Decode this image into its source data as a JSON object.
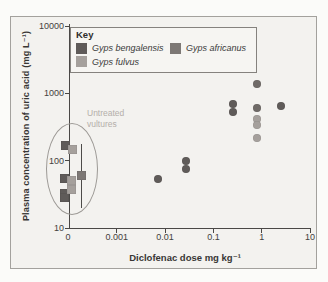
{
  "figure": {
    "legend": {
      "title": "Key",
      "entries": [
        {
          "label": "Gyps bengalensis",
          "color": "#5f5b59"
        },
        {
          "label": "Gyps africanus",
          "color": "#7d7875"
        },
        {
          "label": "Gyps fulvus",
          "color": "#a5a09c"
        }
      ]
    },
    "annotation": {
      "line1": "Untreated",
      "line2": "vultures",
      "color": "#b3afaa"
    }
  },
  "chart_data": {
    "type": "scatter",
    "title": "",
    "xlabel": "Diclofenac dose mg kg⁻¹",
    "ylabel": "Plasma concentration of uric acid (mg L⁻¹)",
    "x_scale": "log",
    "y_scale": "log",
    "xlim": [
      0,
      10
    ],
    "ylim": [
      10,
      10000
    ],
    "grid": false,
    "legend_position": "top-left",
    "x_ticks": [
      {
        "label": "0",
        "value": 0
      },
      {
        "label": "0.001",
        "value": 0.001
      },
      {
        "label": "0.01",
        "value": 0.01
      },
      {
        "label": "0.1",
        "value": 0.1
      },
      {
        "label": "1",
        "value": 1
      },
      {
        "label": "10",
        "value": 10
      }
    ],
    "y_ticks": [
      {
        "label": "10",
        "value": 10
      },
      {
        "label": "100",
        "value": 100
      },
      {
        "label": "1000",
        "value": 1000
      },
      {
        "label": "10000",
        "value": 10000
      }
    ],
    "annotations": [
      {
        "text": "Untreated vultures",
        "target": "dose-zero cluster circled by ellipse"
      }
    ],
    "series": [
      {
        "name": "Gyps bengalensis (treated)",
        "species": "Gyps bengalensis",
        "marker": "circle",
        "group": "treated",
        "color": "#5f5b59",
        "points": [
          {
            "dose": 0.007,
            "uric": 54
          },
          {
            "dose": 0.027,
            "uric": 100
          },
          {
            "dose": 0.027,
            "uric": 75
          },
          {
            "dose": 0.25,
            "uric": 700
          },
          {
            "dose": 0.25,
            "uric": 530
          },
          {
            "dose": 2.5,
            "uric": 650
          }
        ]
      },
      {
        "name": "Gyps africanus (treated)",
        "species": "Gyps africanus",
        "marker": "circle",
        "group": "treated",
        "color": "#6f6a67",
        "points": [
          {
            "dose": 0.8,
            "uric": 1400
          },
          {
            "dose": 0.8,
            "uric": 600
          }
        ]
      },
      {
        "name": "Gyps fulvus (treated)",
        "species": "Gyps fulvus",
        "marker": "circle",
        "group": "treated",
        "color": "#a5a09c",
        "points": [
          {
            "dose": 0.8,
            "uric": 420
          },
          {
            "dose": 0.8,
            "uric": 340
          },
          {
            "dose": 0.8,
            "uric": 215
          }
        ]
      },
      {
        "name": "Gyps bengalensis (untreated)",
        "species": "Gyps bengalensis",
        "marker": "square",
        "group": "untreated",
        "color": "#5f5b59",
        "points": [
          {
            "dose": 0,
            "uric": 170,
            "x_px": 65
          },
          {
            "dose": 0,
            "uric": 55,
            "x_px": 64
          },
          {
            "dose": 0,
            "uric": 33,
            "x_px": 64
          },
          {
            "dose": 0,
            "uric": 28,
            "x_px": 64.5
          }
        ]
      },
      {
        "name": "Gyps fulvus (untreated)",
        "species": "Gyps fulvus",
        "marker": "square",
        "group": "untreated",
        "color": "#a5a09c",
        "points": [
          {
            "dose": 0,
            "uric": 145,
            "x_px": 72
          },
          {
            "dose": 0,
            "uric": 50,
            "x_px": 71.5
          },
          {
            "dose": 0,
            "uric": 37,
            "x_px": 71.5
          }
        ]
      },
      {
        "name": "Gyps africanus (untreated, mean with range)",
        "species": "Gyps africanus",
        "marker": "square",
        "group": "untreated",
        "color": "#7d7875",
        "points": [
          {
            "dose": 0,
            "uric": 60,
            "x_px": 81.5,
            "error_bar": {
              "low": 20,
              "high": 180
            }
          }
        ]
      }
    ]
  }
}
